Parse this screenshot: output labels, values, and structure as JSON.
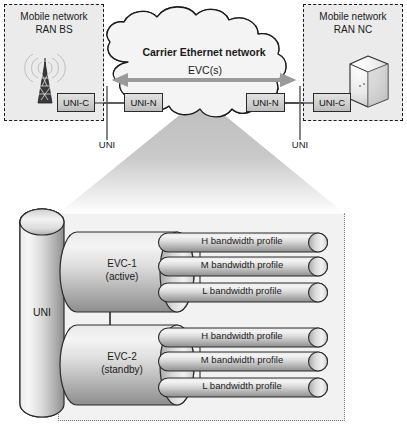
{
  "diagram": {
    "cloud_label": "Carrier Ethernet network",
    "evc_arrow_label": "EVC(s)",
    "left_domain": {
      "line1": "Mobile network",
      "line2": "RAN BS",
      "icon": "cell-tower-icon",
      "uni_c_label": "UNI-C",
      "uni_n_label": "UNI-N",
      "uni_label": "UNI"
    },
    "right_domain": {
      "line1": "Mobile network",
      "line2": "RAN NC",
      "icon": "server-cabinet-icon",
      "uni_c_label": "UNI-C",
      "uni_n_label": "UNI-N",
      "uni_label": "UNI"
    },
    "detail": {
      "uni_cylinder_label": "UNI",
      "evcs": [
        {
          "name": "EVC-1",
          "state": "(active)",
          "profiles": [
            "H bandwidth profile",
            "M bandwidth profile",
            "L bandwidth profile"
          ]
        },
        {
          "name": "EVC-2",
          "state": "(standby)",
          "profiles": [
            "H bandwidth profile",
            "M bandwidth profile",
            "L bandwidth profile"
          ]
        }
      ]
    },
    "colors": {
      "ink": "#1a1a1a",
      "panel_fill": "#ebebeb",
      "detail_fill": "#f2f2f2",
      "cloud_fill": "#f4f4f4",
      "arrow_gray": "#9a9a9a",
      "cylinder_light": "#f1f1f1",
      "cylinder_mid": "#cfcfcf",
      "cylinder_dark": "#9d9d9d"
    }
  }
}
